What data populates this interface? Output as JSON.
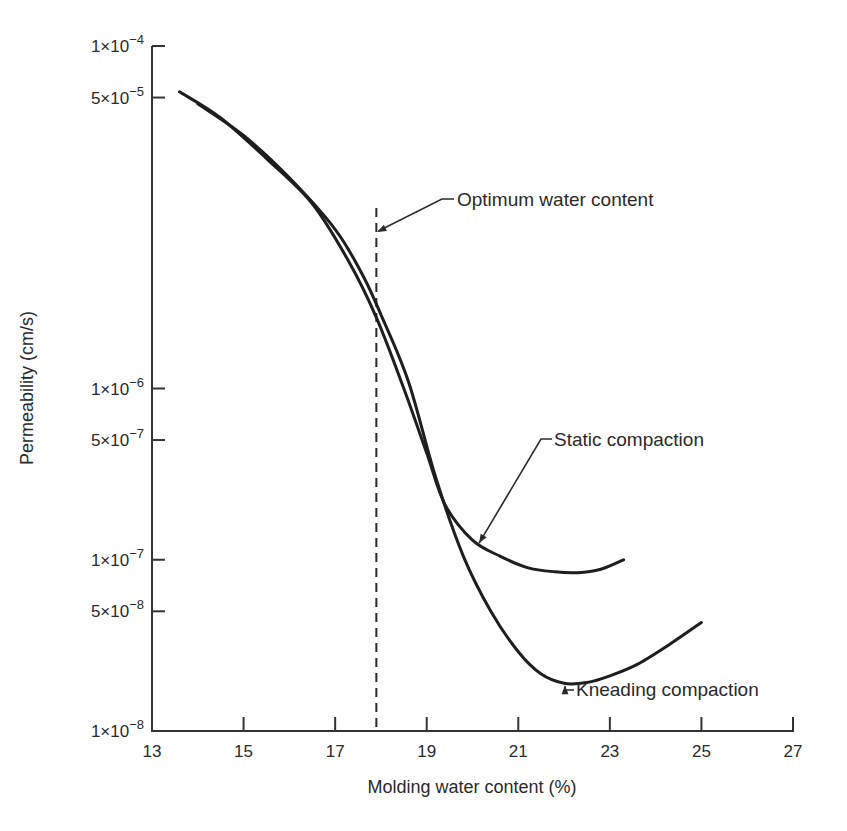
{
  "chart_data": {
    "type": "line",
    "title": "",
    "xlabel": "Molding water content (%)",
    "ylabel": "Permeability (cm/s)",
    "xlim": [
      13,
      27
    ],
    "ylim": [
      1e-08,
      0.0001
    ],
    "yscale": "log",
    "grid": false,
    "legend": "none (curves labeled by annotations)",
    "x_ticks": [
      13,
      15,
      17,
      19,
      21,
      23,
      25,
      27
    ],
    "x_tick_labels": [
      "13",
      "15",
      "17",
      "19",
      "21",
      "23",
      "25",
      "27"
    ],
    "y_ticks": [
      0.0001,
      5e-05,
      1e-06,
      5e-07,
      1e-07,
      5e-08,
      1e-08
    ],
    "y_tick_labels": [
      {
        "mant": "1×10",
        "exp": "−4"
      },
      {
        "mant": "5×10",
        "exp": "−5"
      },
      {
        "mant": "1×10",
        "exp": "−6"
      },
      {
        "mant": "5×10",
        "exp": "−7"
      },
      {
        "mant": "1×10",
        "exp": "−7"
      },
      {
        "mant": "5×10",
        "exp": "−8"
      },
      {
        "mant": "1×10",
        "exp": "−8"
      }
    ],
    "series": [
      {
        "name": "Static compaction",
        "x": [
          13.6,
          14.5,
          15.5,
          16.5,
          17.3,
          17.9,
          18.5,
          19.0,
          19.4,
          20.0,
          20.6,
          21.2,
          21.8,
          22.3,
          22.8,
          23.3
        ],
        "y": [
          5.4e-05,
          3.8e-05,
          2.2e-05,
          1.2e-05,
          5.5e-06,
          2.6e-06,
          1e-06,
          4.2e-07,
          2.1e-07,
          1.3e-07,
          1.05e-07,
          9e-08,
          8.5e-08,
          8.4e-08,
          8.8e-08,
          1e-07
        ]
      },
      {
        "name": "Kneading compaction",
        "x": [
          14.0,
          15.0,
          16.0,
          17.0,
          17.6,
          18.0,
          18.6,
          19.2,
          19.8,
          20.4,
          21.0,
          21.5,
          22.0,
          22.5,
          23.0,
          23.6,
          24.3,
          25.0
        ],
        "y": [
          4.6e-05,
          3e-05,
          1.7e-05,
          8.5e-06,
          4.6e-06,
          2.7e-06,
          1.1e-06,
          3e-07,
          1.05e-07,
          5e-08,
          2.9e-08,
          2.15e-08,
          1.9e-08,
          1.92e-08,
          2.1e-08,
          2.45e-08,
          3.2e-08,
          4.3e-08
        ]
      }
    ],
    "annotations": [
      {
        "text": "Optimum water content",
        "type": "vertical-dashed-line",
        "x": 17.9,
        "y_range": [
          1e-08,
          2.2e-06
        ]
      },
      {
        "text": "Static compaction",
        "points_to": {
          "x": 20.1,
          "y": 1.25e-07
        }
      },
      {
        "text": "Kneading compaction",
        "points_to": {
          "x": 22.0,
          "y": 1.9e-08
        }
      }
    ]
  },
  "labels": {
    "xlabel": "Molding water content (%)",
    "ylabel": "Permeability (cm/s)",
    "optimum": "Optimum water content",
    "static": "Static compaction",
    "kneading": "Kneading compaction"
  }
}
